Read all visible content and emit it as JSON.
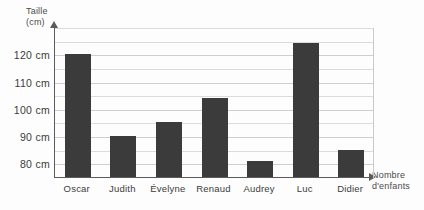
{
  "chart_data": {
    "type": "bar",
    "title": "",
    "ylabel": "Taille (cm)",
    "ylabel_line1": "Taille",
    "ylabel_line2": "(cm)",
    "xlabel": "Nombre d'enfants",
    "xlabel_line1": "Nombre",
    "xlabel_line2": "d'enfants",
    "categories": [
      "Oscar",
      "Judith",
      "Évelyne",
      "Renaud",
      "Audrey",
      "Luc",
      "Didier"
    ],
    "values": [
      120,
      90,
      95,
      104,
      81,
      124,
      85
    ],
    "unit": "cm",
    "ylim": [
      75,
      130
    ],
    "ytick_labels": [
      "120 cm",
      "110 cm",
      "100 cm",
      "90 cm",
      "80 cm"
    ],
    "ytick_values": [
      120,
      110,
      100,
      90,
      80
    ],
    "gridlines": [
      130,
      125,
      120,
      115,
      110,
      105,
      100,
      95,
      90,
      85,
      80
    ],
    "grid": true,
    "legend": "none",
    "bar_color": "#3b3b3b",
    "axis_color": "#5b5b5b",
    "grid_color": "#dcdcdc"
  },
  "axis": {
    "y_title_line1": "Taille",
    "y_title_line2": "(cm)",
    "x_title_line1": "Nombre",
    "x_title_line2": "d'enfants"
  }
}
